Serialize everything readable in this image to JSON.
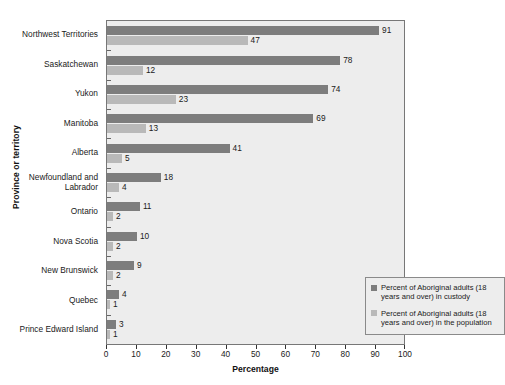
{
  "chart_data": {
    "type": "bar",
    "orientation": "horizontal",
    "title": "",
    "xlabel": "Percentage",
    "ylabel": "Province or territory",
    "xlim": [
      0,
      100
    ],
    "xticks": [
      0,
      10,
      20,
      30,
      40,
      50,
      60,
      70,
      80,
      90,
      100
    ],
    "grid": false,
    "legend_position": "inner-right-lower",
    "categories": [
      "Northwest Territories",
      "Saskatchewan",
      "Yukon",
      "Manitoba",
      "Alberta",
      "Newfoundland and\nLabrador",
      "Ontario",
      "Nova Scotia",
      "New Brunswick",
      "Quebec",
      "Prince Edward Island"
    ],
    "series": [
      {
        "name": "Percent of Aboriginal adults (18 years and over) in custody",
        "key": "custody",
        "color": "#7d7d7d",
        "values": [
          91,
          78,
          74,
          69,
          41,
          18,
          11,
          10,
          9,
          4,
          3
        ]
      },
      {
        "name": "Percent of Aboriginal adults (18 years and over) in the population",
        "key": "population",
        "color": "#b9b9b9",
        "values": [
          47,
          12,
          23,
          13,
          5,
          4,
          2,
          2,
          2,
          1,
          1
        ]
      }
    ]
  },
  "legend": {
    "items": [
      {
        "key": "custody",
        "label": "Percent of Aboriginal adults (18 years and over) in custody",
        "color": "#7d7d7d"
      },
      {
        "key": "population",
        "label": "Percent of Aboriginal adults (18 years and over) in the population",
        "color": "#b9b9b9"
      }
    ]
  },
  "axes": {
    "x_title": "Percentage",
    "y_title": "Province or territory"
  }
}
